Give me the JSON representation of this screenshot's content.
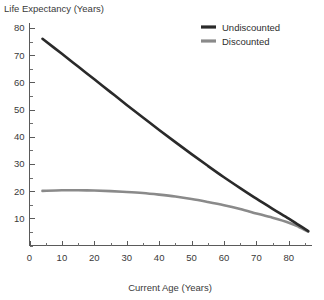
{
  "chart_data": {
    "type": "line",
    "title": "",
    "xlabel": "Current Age (Years)",
    "ylabel": "Life Expectancy (Years)",
    "xlim": [
      0,
      87
    ],
    "ylim": [
      0,
      82
    ],
    "grid": false,
    "legend_position": "top-right",
    "xticks": [
      0,
      10,
      20,
      30,
      40,
      50,
      60,
      70,
      80
    ],
    "xtick_labels": [
      "0",
      "10",
      "20",
      "30",
      "40",
      "50",
      "60",
      "70",
      "80"
    ],
    "x_minor_tick_step": 5,
    "yticks": [
      10,
      20,
      30,
      40,
      50,
      60,
      70,
      80
    ],
    "ytick_labels": [
      "10",
      "20",
      "30",
      "40",
      "50",
      "60",
      "70",
      "80"
    ],
    "y_minor_tick_step": 5,
    "x": [
      4,
      10,
      15,
      20,
      25,
      30,
      35,
      40,
      45,
      50,
      55,
      60,
      65,
      70,
      75,
      80,
      83,
      86
    ],
    "series": [
      {
        "name": "Undiscounted",
        "color": "#2a2a2a",
        "width": 2.6,
        "values": [
          76.0,
          70.5,
          65.8,
          61.1,
          56.4,
          51.7,
          47.1,
          42.5,
          38.0,
          33.6,
          29.3,
          25.1,
          21.1,
          17.2,
          13.5,
          9.9,
          7.6,
          5.3
        ]
      },
      {
        "name": "Discounted",
        "color": "#8a8a8a",
        "width": 2.6,
        "values": [
          20.1,
          20.3,
          20.3,
          20.2,
          20.0,
          19.7,
          19.3,
          18.7,
          18.0,
          17.1,
          16.0,
          14.8,
          13.4,
          11.8,
          10.2,
          8.4,
          6.9,
          5.1
        ]
      }
    ]
  },
  "legend": {
    "items": [
      {
        "label": "Undiscounted",
        "color": "#2a2a2a"
      },
      {
        "label": "Discounted",
        "color": "#8a8a8a"
      }
    ]
  },
  "axes": {
    "y_title": "Life Expectancy (Years)",
    "x_title": "Current Age (Years)"
  }
}
